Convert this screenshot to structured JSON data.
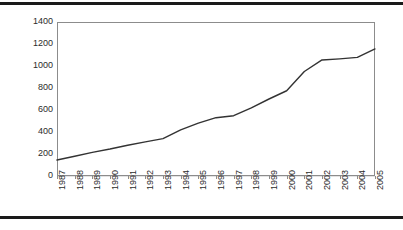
{
  "figure": {
    "background_color": "#ffffff",
    "rule_color": "#1a1a1a",
    "has_top_rule": true,
    "has_bottom_rule": true
  },
  "chart_data": {
    "type": "line",
    "title": "",
    "subtitle": "",
    "xlabel": "",
    "ylabel": "",
    "categories": [
      "1987",
      "1988",
      "1989",
      "1990",
      "1991",
      "1992",
      "1993",
      "1994",
      "1995",
      "1996",
      "1997",
      "1998",
      "1999",
      "2000",
      "2001",
      "2002",
      "2003",
      "2004",
      "2005"
    ],
    "values": [
      145,
      180,
      215,
      245,
      280,
      310,
      340,
      420,
      480,
      530,
      548,
      620,
      700,
      775,
      950,
      1055,
      1065,
      1078,
      1155
    ],
    "series": [
      {
        "name": "series-1",
        "color": "#333333",
        "line_width": 1.4,
        "values": [
          145,
          180,
          215,
          245,
          280,
          310,
          340,
          420,
          480,
          530,
          548,
          620,
          700,
          775,
          950,
          1055,
          1065,
          1078,
          1155
        ]
      }
    ],
    "ylim": [
      0,
      1400
    ],
    "yticks": [
      0,
      200,
      400,
      600,
      800,
      1000,
      1200,
      1400
    ],
    "ytick_labels": [
      "0",
      "200",
      "400",
      "600",
      "800",
      "1000",
      "1200",
      "1400"
    ],
    "xtick_labels": [
      "1987",
      "1988",
      "1989",
      "1990",
      "1991",
      "1992",
      "1993",
      "1994",
      "1995",
      "1996",
      "1997",
      "1998",
      "1999",
      "2000",
      "2001",
      "2002",
      "2003",
      "2004",
      "2005"
    ],
    "xtick_rotation": -90,
    "grid": {
      "horizontal": true,
      "vertical": false,
      "color": "#e3e3e3"
    },
    "legend": {
      "visible": false,
      "position": "none",
      "entries": []
    },
    "markers": false,
    "annotations": []
  }
}
